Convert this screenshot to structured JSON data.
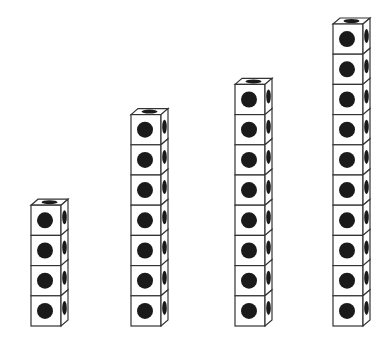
{
  "diagram": {
    "baseline_y": 326,
    "cube": {
      "front_width": 30,
      "height": 30.2,
      "depth_dx": 7,
      "depth_dy": 6,
      "front_dot_radius": 8,
      "stroke_color": "#333333",
      "fill_color": "#ffffff",
      "dot_color": "#1a1a1a"
    },
    "stacks": [
      {
        "label": "stack-1",
        "cube_count": 4,
        "front_left_x": 31
      },
      {
        "label": "stack-2",
        "cube_count": 7,
        "front_left_x": 131
      },
      {
        "label": "stack-3",
        "cube_count": 8,
        "front_left_x": 235
      },
      {
        "label": "stack-4",
        "cube_count": 10,
        "front_left_x": 333
      }
    ]
  }
}
